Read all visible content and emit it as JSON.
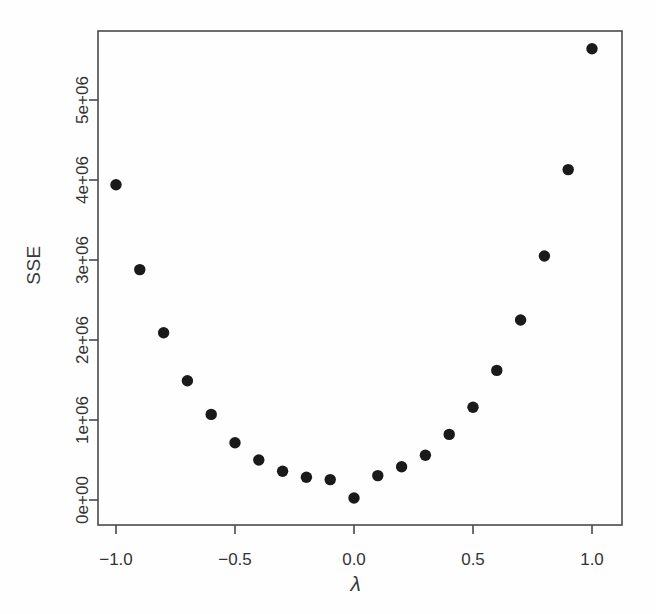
{
  "figure": {
    "background": "#fefefe",
    "ink_color": "#333333",
    "point_color": "#1a1a1a",
    "frame_color": "#4a4a4a"
  },
  "labels": {
    "ylabel": "SSE",
    "xlabel": "λ"
  },
  "chart_data": {
    "type": "scatter",
    "title": "",
    "xlabel": "λ",
    "ylabel": "SSE",
    "grid": false,
    "legend": null,
    "xlim": [
      -1.1,
      1.1
    ],
    "ylim": [
      -250000,
      6050000
    ],
    "xticks": [
      -1.0,
      -0.5,
      0.0,
      0.5,
      1.0
    ],
    "xticklabels": [
      "−1.0",
      "−0.5",
      "0.0",
      "0.5",
      "1.0"
    ],
    "yticks": [
      0,
      1000000,
      2000000,
      3000000,
      4000000,
      5000000
    ],
    "yticklabels": [
      "0e+00",
      "1e+06",
      "2e+06",
      "3e+06",
      "4e+06",
      "5e+06"
    ],
    "marker": "filled-circle",
    "marker_size": 7,
    "x": [
      -1.0,
      -0.9,
      -0.8,
      -0.7,
      -0.6,
      -0.5,
      -0.4,
      -0.3,
      -0.2,
      -0.1,
      0.0,
      0.1,
      0.2,
      0.3,
      0.4,
      0.5,
      0.6,
      0.7,
      0.8,
      0.9,
      1.0
    ],
    "y": [
      3940000,
      2880000,
      2090000,
      1490000,
      1070000,
      715000,
      500000,
      360000,
      285000,
      255000,
      25000,
      305000,
      415000,
      560000,
      820000,
      1160000,
      1620000,
      2250000,
      3050000,
      4130000,
      5640000
    ],
    "point_labels": [
      "λ=-1.0",
      "λ=-0.9",
      "λ=-0.8",
      "λ=-0.7",
      "λ=-0.6",
      "λ=-0.5",
      "λ=-0.4",
      "λ=-0.3",
      "λ=-0.2",
      "λ=-0.1",
      "λ=0.0",
      "λ=0.1",
      "λ=0.2",
      "λ=0.3",
      "λ=0.4",
      "λ=0.5",
      "λ=0.6",
      "λ=0.7",
      "λ=0.8",
      "λ=0.9",
      "λ=1.0"
    ]
  },
  "geometry": {
    "plot_left": 98,
    "plot_right": 622,
    "plot_top": 31,
    "plot_bottom": 525,
    "x_pixel_at_zero": 354,
    "x_pixels_per_unit": 238,
    "y_pixel_at_zero": 500,
    "y_pixels_per_1e6": 80
  }
}
